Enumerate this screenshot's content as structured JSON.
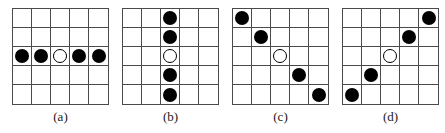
{
  "figure": {
    "grid_rows": 5,
    "grid_cols": 5,
    "colors": {
      "grid_line": "#4a4a4a",
      "dot_fill": "#000000",
      "background": "#ffffff"
    },
    "panels": [
      {
        "label": "(a)",
        "pattern": "horizontal-middle-row",
        "dots": [
          {
            "row": 2,
            "col": 0,
            "type": "filled"
          },
          {
            "row": 2,
            "col": 1,
            "type": "filled"
          },
          {
            "row": 2,
            "col": 2,
            "type": "open"
          },
          {
            "row": 2,
            "col": 3,
            "type": "filled"
          },
          {
            "row": 2,
            "col": 4,
            "type": "filled"
          }
        ]
      },
      {
        "label": "(b)",
        "pattern": "vertical-middle-column",
        "dots": [
          {
            "row": 0,
            "col": 2,
            "type": "filled"
          },
          {
            "row": 1,
            "col": 2,
            "type": "filled"
          },
          {
            "row": 2,
            "col": 2,
            "type": "open"
          },
          {
            "row": 3,
            "col": 2,
            "type": "filled"
          },
          {
            "row": 4,
            "col": 2,
            "type": "filled"
          }
        ]
      },
      {
        "label": "(c)",
        "pattern": "main-diagonal",
        "dots": [
          {
            "row": 0,
            "col": 0,
            "type": "filled"
          },
          {
            "row": 1,
            "col": 1,
            "type": "filled"
          },
          {
            "row": 2,
            "col": 2,
            "type": "open"
          },
          {
            "row": 3,
            "col": 3,
            "type": "filled"
          },
          {
            "row": 4,
            "col": 4,
            "type": "filled"
          }
        ]
      },
      {
        "label": "(d)",
        "pattern": "anti-diagonal",
        "dots": [
          {
            "row": 0,
            "col": 4,
            "type": "filled"
          },
          {
            "row": 1,
            "col": 3,
            "type": "filled"
          },
          {
            "row": 2,
            "col": 2,
            "type": "open"
          },
          {
            "row": 3,
            "col": 1,
            "type": "filled"
          },
          {
            "row": 4,
            "col": 0,
            "type": "filled"
          }
        ]
      }
    ]
  }
}
